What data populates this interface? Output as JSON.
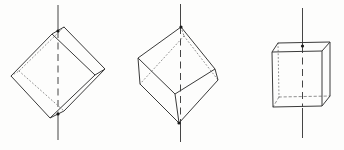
{
  "canvas": {
    "width": 344,
    "height": 150,
    "background": "#fdfdfc"
  },
  "style": {
    "edge_color": "#3a3a3a",
    "edge_width": 1,
    "hidden_color": "#828282",
    "hidden_width": 0.9,
    "axis_color": "#454545",
    "axis_width": 1,
    "axis_dash": "7 4.5",
    "dot_color": "#1a1a1a",
    "dot_radius": 1.6
  },
  "figures": [
    {
      "id": "cube-on-edge-axis-through-edge-midpoints",
      "vertices": {
        "t1": [
          52,
          34
        ],
        "t2": [
          64,
          27
        ],
        "f1": [
          95,
          75
        ],
        "f2": [
          105,
          69
        ],
        "k1": [
          11,
          76
        ],
        "k2": [
          19,
          71
        ],
        "b1": [
          50,
          118
        ],
        "b2": [
          64,
          111
        ]
      },
      "solid": [
        [
          "t1",
          "t2"
        ],
        [
          "t2",
          "f2"
        ],
        [
          "f1",
          "f2"
        ],
        [
          "t1",
          "f1"
        ],
        [
          "t1",
          "k1"
        ],
        [
          "k1",
          "b1"
        ],
        [
          "b1",
          "b2"
        ],
        [
          "b2",
          "f2"
        ],
        [
          "b1",
          "f1"
        ]
      ],
      "hidden": [
        [
          "t2",
          "k2"
        ],
        [
          "k1",
          "k2"
        ],
        [
          "k2",
          "b2"
        ]
      ],
      "hidden_dash": "1 2.6",
      "axis": {
        "x": 58,
        "segments": [
          [
            5,
            31
          ],
          [
            114,
            140
          ]
        ],
        "dashed": [
          31,
          114
        ]
      },
      "dots": [
        [
          58,
          31
        ],
        [
          58,
          114
        ]
      ]
    },
    {
      "id": "cube-on-vertex-axis-through-space-diagonal",
      "vertices": {
        "t": [
          181,
          27
        ],
        "ul": [
          138,
          58
        ],
        "ur": [
          215,
          69
        ],
        "h": [
          184,
          36
        ],
        "ll": [
          140,
          84
        ],
        "lr": [
          218,
          80
        ],
        "f": [
          175,
          94
        ],
        "b": [
          179,
          123
        ]
      },
      "solid": [
        [
          "t",
          "ul"
        ],
        [
          "t",
          "ur"
        ],
        [
          "ul",
          "ll"
        ],
        [
          "ur",
          "lr"
        ],
        [
          "ul",
          "f"
        ],
        [
          "ur",
          "f"
        ],
        [
          "b",
          "ll"
        ],
        [
          "b",
          "lr"
        ],
        [
          "b",
          "f"
        ]
      ],
      "hidden": [
        [
          "t",
          "h"
        ],
        [
          "h",
          "ll"
        ],
        [
          "h",
          "lr"
        ]
      ],
      "hidden_dash": "1 2.6",
      "axis": {
        "x": 180.5,
        "segments": [
          [
            4,
            27
          ],
          [
            123,
            142
          ]
        ],
        "dashed": [
          27,
          123
        ]
      },
      "dots": [
        [
          181,
          27
        ],
        [
          179,
          123
        ]
      ]
    },
    {
      "id": "upright-cube-axis-through-face-centers",
      "vertices": {
        "ftl": [
          272,
          52
        ],
        "ftr": [
          322,
          51
        ],
        "btr": [
          330,
          42
        ],
        "btl": [
          278,
          43
        ],
        "fbl": [
          273,
          107
        ],
        "fbr": [
          322,
          106
        ],
        "bbr": [
          330,
          96
        ],
        "bbl": [
          279,
          97
        ]
      },
      "solid": [
        [
          "ftl",
          "ftr"
        ],
        [
          "ftr",
          "btr"
        ],
        [
          "btr",
          "btl"
        ],
        [
          "btl",
          "ftl"
        ],
        [
          "ftl",
          "fbl"
        ],
        [
          "ftr",
          "fbr"
        ],
        [
          "btr",
          "bbr"
        ],
        [
          "fbl",
          "fbr"
        ],
        [
          "fbr",
          "bbr"
        ]
      ],
      "hidden": [
        [
          "btl",
          "bbl",
          "1 2.6"
        ],
        [
          "bbl",
          "bbr"
        ],
        [
          "bbl",
          "fbl"
        ]
      ],
      "hidden_dash": "2.4 2.6",
      "axis": {
        "x": 302.5,
        "segments": [
          [
            8,
            46
          ],
          [
            108,
            138
          ]
        ],
        "dashed": [
          46,
          107
        ]
      },
      "dots": [
        [
          302.5,
          46
        ]
      ]
    }
  ]
}
